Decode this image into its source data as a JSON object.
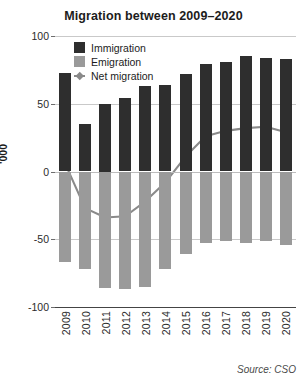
{
  "chart_data": {
    "type": "bar",
    "title": "Migration between 2009–2020",
    "xlabel": "",
    "ylabel": "'000",
    "ylim": [
      -100,
      100
    ],
    "yticks": [
      100,
      50,
      0,
      -50,
      -100
    ],
    "ytick_labels": [
      "100",
      "50",
      "0",
      "-50",
      "-100"
    ],
    "grid": true,
    "legend_position": "top-left inside plot",
    "categories": [
      "2009",
      "2010",
      "2011",
      "2012",
      "2013",
      "2014",
      "2015",
      "2016",
      "2017",
      "2018",
      "2019",
      "2020"
    ],
    "series": [
      {
        "name": "Immigration",
        "type": "bar",
        "color": "#2e2e2e",
        "values": [
          73,
          35,
          50,
          54,
          63,
          64,
          72,
          79,
          81,
          85,
          84,
          83
        ]
      },
      {
        "name": "Emigration",
        "type": "bar",
        "color": "#9a9a9a",
        "values": [
          -67,
          -72,
          -86,
          -87,
          -85,
          -72,
          -61,
          -53,
          -51,
          -53,
          -51,
          -54
        ]
      },
      {
        "name": "Net migration",
        "type": "line",
        "color": "#8a8a8a",
        "values": [
          6,
          -27,
          -34,
          -33,
          -22,
          -8,
          11,
          26,
          30,
          32,
          33,
          29
        ]
      }
    ],
    "source": "Source: CSO"
  },
  "legend": {
    "items": [
      {
        "label": "Immigration"
      },
      {
        "label": "Emigration"
      },
      {
        "label": "Net migration"
      }
    ]
  },
  "colors": {
    "immigration": "#2e2e2e",
    "emigration": "#9a9a9a",
    "net_migration": "#8a8a8a",
    "grid": "#c9c9c9",
    "text": "#1c1c1c"
  }
}
